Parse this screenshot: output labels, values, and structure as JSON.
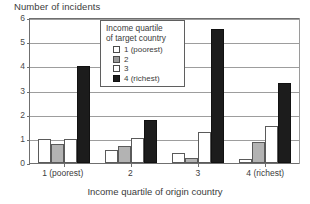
{
  "chart_data": {
    "type": "bar",
    "title": "Number of incidents",
    "ylabel": "Number of incidents",
    "xlabel": "Income quartile of origin country",
    "categories": [
      "1 (poorest)",
      "2",
      "3",
      "4 (richest)"
    ],
    "series": [
      {
        "name": "1 (poorest)",
        "color": "#ffffff",
        "values": [
          1.0,
          0.55,
          0.4,
          0.15
        ]
      },
      {
        "name": "2",
        "color": "#b3b3b3",
        "values": [
          0.8,
          0.7,
          0.2,
          0.85
        ]
      },
      {
        "name": "3",
        "color": "#ffffff",
        "values": [
          1.0,
          1.05,
          1.3,
          1.55
        ]
      },
      {
        "name": "4 (richest)",
        "color": "#1c1c1c",
        "values": [
          4.0,
          1.8,
          5.55,
          3.3
        ]
      }
    ],
    "ylim": [
      0,
      6
    ],
    "yticks": [
      "0",
      "1",
      "2",
      "3",
      "4",
      "5",
      "6"
    ],
    "grid": true,
    "legend": {
      "position": "top-center-inside",
      "title_line1": "Income quartile",
      "title_line2": "of target country",
      "entries": [
        "1 (poorest)",
        "2",
        "3",
        "4 (richest)"
      ]
    }
  },
  "axes": {
    "y_title": "Number of incidents",
    "x_title": "Income quartile of origin country",
    "y_ticks": [
      "6",
      "5",
      "4",
      "3",
      "2",
      "1",
      "0"
    ],
    "x_labels": [
      "1 (poorest)",
      "2",
      "3",
      "4 (richest)"
    ]
  },
  "legend": {
    "title_line1": "Income quartile",
    "title_line2": "of target country",
    "items": [
      {
        "label": "1 (poorest)"
      },
      {
        "label": "2"
      },
      {
        "label": "3"
      },
      {
        "label": "4 (richest)"
      }
    ]
  }
}
